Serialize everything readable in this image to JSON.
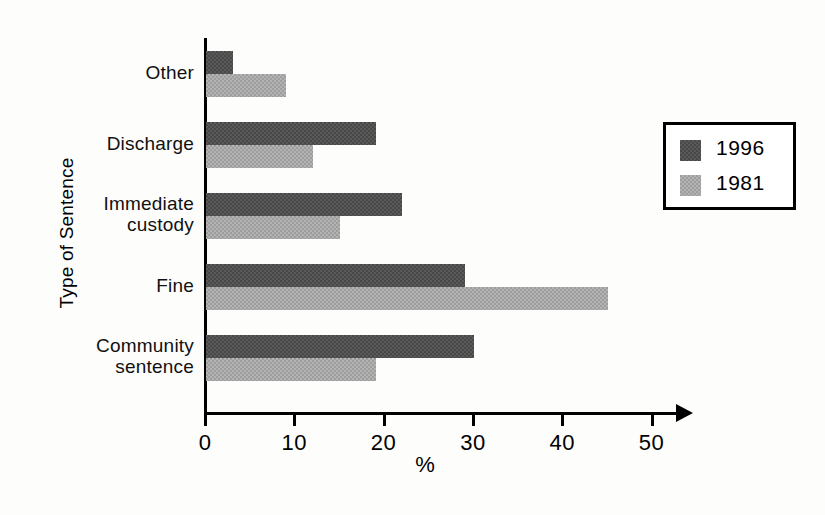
{
  "chart_data": {
    "type": "bar",
    "orientation": "horizontal",
    "title": "",
    "xlabel": "%",
    "ylabel": "Type of Sentence",
    "categories": [
      "Other",
      "Discharge",
      "Immediate custody",
      "Fine",
      "Community sentence"
    ],
    "category_labels_wrapped": [
      [
        "Other"
      ],
      [
        "Discharge"
      ],
      [
        "Immediate",
        "custody"
      ],
      [
        "Fine"
      ],
      [
        "Community",
        "sentence"
      ]
    ],
    "series": [
      {
        "name": "1996",
        "color": "#5a5a5a",
        "values": [
          3,
          19,
          22,
          29,
          30
        ]
      },
      {
        "name": "1981",
        "color": "#9d9d9d",
        "values": [
          9,
          12,
          15,
          45,
          19
        ]
      }
    ],
    "xlim": [
      0,
      50
    ],
    "xticks": [
      0,
      10,
      20,
      30,
      40,
      50
    ],
    "xtick_labels": [
      "0",
      "10",
      "20",
      "30",
      "40",
      "50"
    ],
    "grid": false,
    "legend_position": "right",
    "axis_arrow": true
  },
  "axes": {
    "y_title": "Type of Sentence",
    "x_title": "%"
  },
  "legend": {
    "entries": [
      {
        "label": "1996",
        "color": "#5a5a5a"
      },
      {
        "label": "1981",
        "color": "#9d9d9d"
      }
    ]
  }
}
